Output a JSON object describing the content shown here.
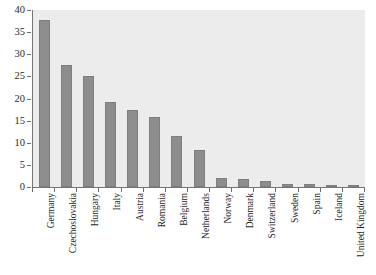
{
  "chart_data": {
    "type": "bar",
    "title": "",
    "subtitle": "",
    "xlabel": "",
    "ylabel": "",
    "ylim": [
      0,
      40
    ],
    "yticks": [
      0,
      5,
      10,
      15,
      20,
      25,
      30,
      35,
      40
    ],
    "ytick_labels": [
      "0",
      "5",
      "10",
      "15",
      "20",
      "25",
      "30",
      "35",
      "40"
    ],
    "grid": false,
    "legend": null,
    "legend_position": "none",
    "orientation": "vertical",
    "bar_color": "#8d8d8d",
    "plot_background": "#ececec",
    "figure_background": "#ffffff",
    "axis_color": "#757575",
    "categories": [
      "Germany",
      "Czechoslovakia",
      "Hungary",
      "Italy",
      "Austria",
      "Romania",
      "Belgium",
      "Netherlands",
      "Norway",
      "Denmark",
      "Switzerland",
      "Sweden",
      "Spain",
      "Iceland",
      "United Kingdom"
    ],
    "values": [
      37.8,
      27.6,
      25.1,
      19.2,
      17.4,
      15.8,
      11.5,
      8.4,
      2.0,
      1.8,
      1.4,
      0.7,
      0.7,
      0.5,
      0.1
    ]
  }
}
